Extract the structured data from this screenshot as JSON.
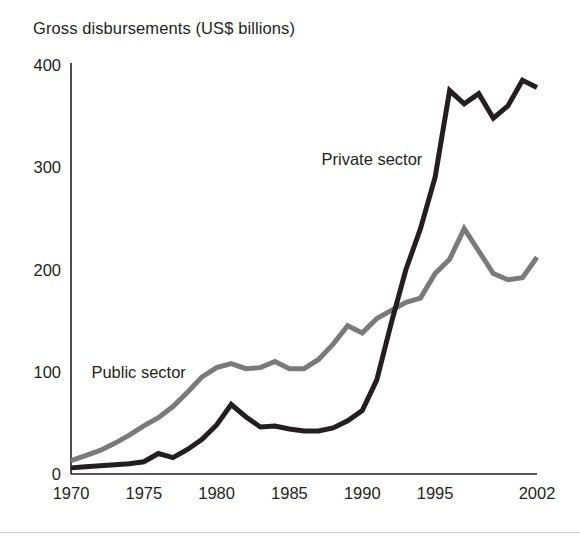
{
  "figure": {
    "title": "Gross disbursements (US$ billions)",
    "background": "#ffffff",
    "axis_color": "#231f20",
    "rule_color": "#c9c9c9"
  },
  "chart_data": {
    "type": "line",
    "title": "Gross disbursements (US$ billions)",
    "xlabel": "",
    "ylabel": "Gross disbursements (US$ billions)",
    "xlim": [
      1970,
      2002
    ],
    "ylim": [
      0,
      400
    ],
    "yticks": [
      0,
      100,
      200,
      300,
      400
    ],
    "ytick_labels": [
      "0",
      "100",
      "200",
      "300",
      "400"
    ],
    "xticks": [
      1970,
      1975,
      1980,
      1985,
      1990,
      1995,
      2002
    ],
    "xtick_labels": [
      "1970",
      "1975",
      "1980",
      "1985",
      "1990",
      "1995",
      "2002"
    ],
    "grid": false,
    "legend": "inline-annotations",
    "x": [
      1970,
      1971,
      1972,
      1973,
      1974,
      1975,
      1976,
      1977,
      1978,
      1979,
      1980,
      1981,
      1982,
      1983,
      1984,
      1985,
      1986,
      1987,
      1988,
      1989,
      1990,
      1991,
      1992,
      1993,
      1994,
      1995,
      1996,
      1997,
      1998,
      1999,
      2000,
      2001,
      2002
    ],
    "series": [
      {
        "name": "Public sector",
        "color": "#7a7a7a",
        "stroke_width": 5,
        "label": "Public sector",
        "label_x": 1971.4,
        "label_y": 100,
        "values": [
          13,
          18,
          23,
          30,
          38,
          47,
          55,
          66,
          80,
          95,
          104,
          108,
          103,
          104,
          110,
          103,
          103,
          112,
          127,
          145,
          138,
          152,
          160,
          168,
          172,
          196,
          210,
          240,
          218,
          196,
          190,
          192,
          212
        ]
      },
      {
        "name": "Private sector",
        "color": "#231f20",
        "stroke_width": 5,
        "label": "Private sector",
        "label_x": 1987.2,
        "label_y": 308,
        "values": [
          6,
          7,
          8,
          9,
          10,
          12,
          20,
          16,
          24,
          34,
          48,
          68,
          56,
          46,
          47,
          44,
          42,
          42,
          45,
          52,
          62,
          92,
          148,
          200,
          240,
          290,
          375,
          362,
          372,
          348,
          360,
          385,
          378
        ]
      }
    ]
  }
}
